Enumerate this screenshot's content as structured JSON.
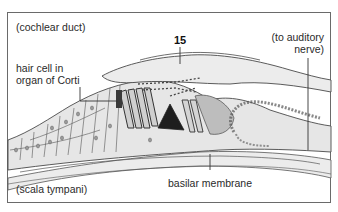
{
  "diagram": {
    "type": "anatomical cross-section",
    "labels": {
      "cochlear_duct": "(cochlear duct)",
      "hair_cell_line1": "hair cell in",
      "hair_cell_line2": "organ of Corti",
      "number": "15",
      "auditory_nerve_line1": "(to auditory",
      "auditory_nerve_line2": "nerve)",
      "basilar_membrane": "basilar membrane",
      "scala_tympani": "(scala tympani)"
    },
    "colors": {
      "tissue_fill": "#e6e6e6",
      "tissue_light": "#efefef",
      "line": "#4a4a4a",
      "dark_tunnel": "#1e1e1e",
      "frame": "#6a6a6a"
    }
  }
}
